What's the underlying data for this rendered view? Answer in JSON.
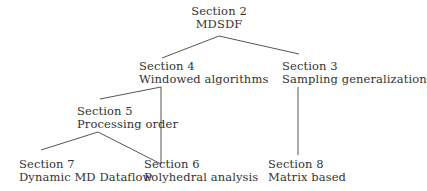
{
  "diagram": {
    "type": "tree",
    "nodes": [
      {
        "id": "s2",
        "section": "Section 2",
        "title": "MDSDF"
      },
      {
        "id": "s4",
        "section": "Section 4",
        "title": "Windowed algorithms"
      },
      {
        "id": "s3",
        "section": "Section 3",
        "title": "Sampling generalization"
      },
      {
        "id": "s5",
        "section": "Section 5",
        "title": "Processing order"
      },
      {
        "id": "s7",
        "section": "Section 7",
        "title": "Dynamic MD Dataflow"
      },
      {
        "id": "s6",
        "section": "Section 6",
        "title": "Polyhedral analysis"
      },
      {
        "id": "s8",
        "section": "Section 8",
        "title": "Matrix based"
      }
    ],
    "edges": [
      {
        "from": "s2",
        "to": "s4"
      },
      {
        "from": "s2",
        "to": "s3"
      },
      {
        "from": "s4",
        "to": "s5"
      },
      {
        "from": "s4",
        "to": "s6"
      },
      {
        "from": "s5",
        "to": "s7"
      },
      {
        "from": "s5",
        "to": "s6"
      },
      {
        "from": "s3",
        "to": "s8"
      }
    ],
    "colors": {
      "text": "#333333",
      "edge": "#555555",
      "background": "#ffffff"
    }
  }
}
